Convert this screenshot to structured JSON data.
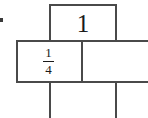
{
  "diagram": {
    "type": "fraction-bar-model",
    "whole": {
      "label": "1"
    },
    "part": {
      "numerator": "1",
      "denominator": "4",
      "label": "1/4"
    },
    "colors": {
      "line": "#4a4a4a",
      "text": "#1a1a1a",
      "background": "#ffffff"
    }
  }
}
